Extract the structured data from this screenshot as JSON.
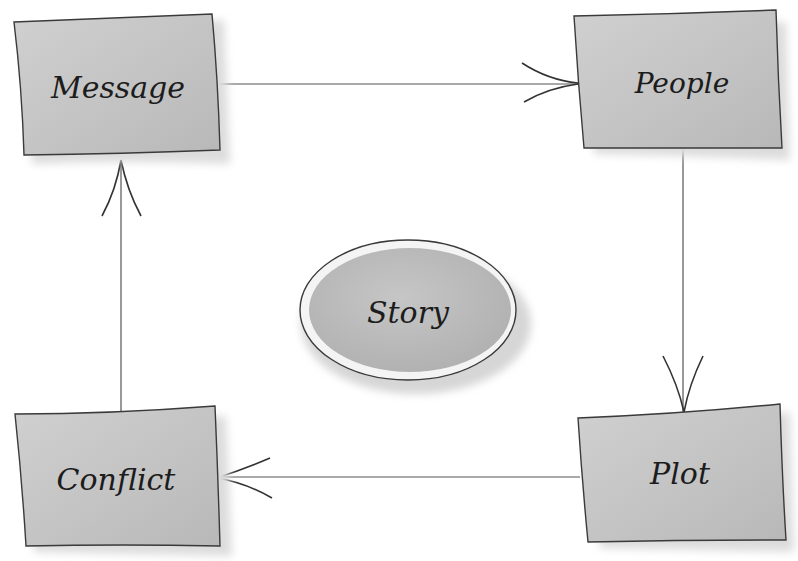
{
  "diagram": {
    "center": {
      "label": "Story"
    },
    "nodes": [
      {
        "id": "message",
        "label": "Message"
      },
      {
        "id": "people",
        "label": "People"
      },
      {
        "id": "plot",
        "label": "Plot"
      },
      {
        "id": "conflict",
        "label": "Conflict"
      }
    ],
    "edges": [
      {
        "from": "Message",
        "to": "People"
      },
      {
        "from": "People",
        "to": "Plot"
      },
      {
        "from": "Plot",
        "to": "Conflict"
      },
      {
        "from": "Conflict",
        "to": "Message"
      }
    ],
    "colors": {
      "box_fill": "#c4c4c4",
      "box_stroke": "#3a3a3a",
      "shadow": "#d8d8d8",
      "line": "#4a4a4a"
    }
  }
}
